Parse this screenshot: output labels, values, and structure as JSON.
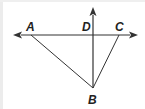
{
  "diagram": {
    "type": "geometry",
    "colors": {
      "stroke": "#333333",
      "label": "#222222",
      "background": "#ffffff"
    },
    "points": [
      {
        "id": "A",
        "label": "A",
        "x": 31,
        "y": 35,
        "label_x": 26,
        "label_y": 31
      },
      {
        "id": "D",
        "label": "D",
        "x": 93,
        "y": 35,
        "label_x": 82,
        "label_y": 31
      },
      {
        "id": "C",
        "label": "C",
        "x": 119,
        "y": 35,
        "label_x": 115,
        "label_y": 31
      },
      {
        "id": "B",
        "label": "B",
        "x": 93,
        "y": 88,
        "label_x": 88,
        "label_y": 104
      }
    ],
    "lines": [
      {
        "name": "line-AC",
        "type": "line",
        "from": [
          14,
          35
        ],
        "to": [
          137,
          35
        ],
        "arrows": "both"
      },
      {
        "name": "ray-BD",
        "type": "ray",
        "from": [
          93,
          88
        ],
        "to": [
          93,
          8
        ],
        "arrows": "end"
      }
    ],
    "segments": [
      {
        "name": "segment-AB",
        "from": "A",
        "to": "B"
      },
      {
        "name": "segment-CB",
        "from": "C",
        "to": "B"
      }
    ]
  }
}
